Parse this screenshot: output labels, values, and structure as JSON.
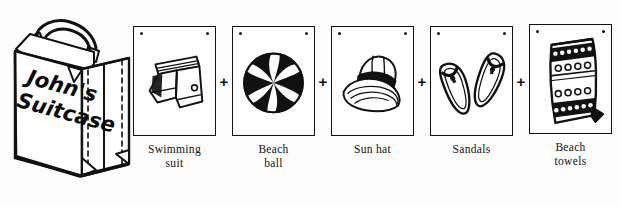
{
  "scene": {
    "type": "worksheet-illustration",
    "background_color": "#fdfdfd",
    "ink_color": "#111111"
  },
  "suitcase": {
    "name": "johns-suitcase",
    "label_line1": "John's",
    "label_line2": "Suitcase",
    "description": "open-perspective travel suitcase with handle"
  },
  "operator": {
    "symbol": "+"
  },
  "items": [
    {
      "icon": "swimming-shorts-icon",
      "label_line1": "Swimming",
      "label_line2": "suit"
    },
    {
      "icon": "beach-ball-icon",
      "label_line1": "Beach",
      "label_line2": "ball"
    },
    {
      "icon": "sun-hat-icon",
      "label_line1": "Sun hat",
      "label_line2": ""
    },
    {
      "icon": "sandals-icon",
      "label_line1": "Sandals",
      "label_line2": ""
    },
    {
      "icon": "beach-towel-icon",
      "label_line1": "Beach",
      "label_line2": "towels"
    }
  ]
}
